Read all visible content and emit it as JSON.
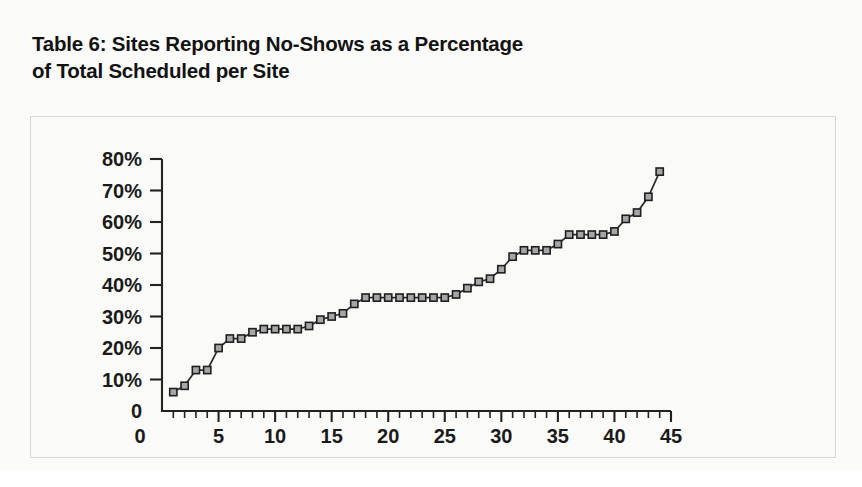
{
  "figure": {
    "title": "Table 6: Sites Reporting No-Shows as a Percentage\nof Total Scheduled per Site",
    "frame_border_color": "#d9d9d9",
    "background_color": "#fafaf9"
  },
  "chart_data": {
    "type": "line",
    "title": "Table 6: Sites Reporting No-Shows as a Percentage of Total Scheduled per Site",
    "xlabel": "",
    "ylabel": "",
    "xlim": [
      0,
      45
    ],
    "ylim": [
      0,
      80
    ],
    "grid": false,
    "legend": null,
    "marker": "square",
    "marker_fill_color": "#a6a6a6",
    "marker_edge_color": "#1f1f1f",
    "line_color": "#2a2a2a",
    "y_tick_labels": [
      "0",
      "10%",
      "20%",
      "30%",
      "40%",
      "50%",
      "60%",
      "70%",
      "80%"
    ],
    "y_tick_values": [
      0,
      10,
      20,
      30,
      40,
      50,
      60,
      70,
      80
    ],
    "x_tick_labels": [
      "0",
      "5",
      "10",
      "15",
      "20",
      "25",
      "30",
      "35",
      "40",
      "45"
    ],
    "x_tick_values": [
      0,
      5,
      10,
      15,
      20,
      25,
      30,
      35,
      40,
      45
    ],
    "x_minor_tick_step": 1,
    "x": [
      1,
      2,
      3,
      4,
      5,
      6,
      7,
      8,
      9,
      10,
      11,
      12,
      13,
      14,
      15,
      16,
      17,
      18,
      19,
      20,
      21,
      22,
      23,
      24,
      25,
      26,
      27,
      28,
      29,
      30,
      31,
      32,
      33,
      34,
      35,
      36,
      37,
      38,
      39,
      40,
      41,
      42,
      43,
      44
    ],
    "values": [
      6,
      8,
      13,
      13,
      20,
      23,
      23,
      25,
      26,
      26,
      26,
      26,
      27,
      29,
      30,
      31,
      34,
      36,
      36,
      36,
      36,
      36,
      36,
      36,
      36,
      37,
      39,
      41,
      42,
      45,
      49,
      51,
      51,
      51,
      53,
      56,
      56,
      56,
      56,
      57,
      61,
      63,
      68,
      76
    ],
    "series": [
      {
        "name": "No-shows as % of total scheduled",
        "values": [
          6,
          8,
          13,
          13,
          20,
          23,
          23,
          25,
          26,
          26,
          26,
          26,
          27,
          29,
          30,
          31,
          34,
          36,
          36,
          36,
          36,
          36,
          36,
          36,
          36,
          37,
          39,
          41,
          42,
          45,
          49,
          51,
          51,
          51,
          53,
          56,
          56,
          56,
          56,
          57,
          61,
          63,
          68,
          76
        ]
      }
    ]
  }
}
